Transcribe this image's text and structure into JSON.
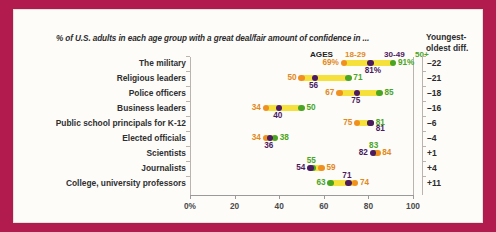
{
  "header": {
    "title": "% of U.S. adults in each age group with a great deal/fair amount of confidence in ...",
    "diff_header": "Youngest-\noldest diff."
  },
  "legend": {
    "ages_label": "AGES",
    "young": "18-29",
    "mid": "30-49",
    "old": "50+"
  },
  "colors": {
    "young": "#f0901e",
    "mid": "#4b1a60",
    "old": "#4aa522",
    "track": "#f5e03c",
    "frame": "#b21b4d",
    "card": "#fdfcf9"
  },
  "chart_data": {
    "type": "scatter",
    "subtype": "dumbbell",
    "title": "% of U.S. adults in each age group with a great deal/fair amount of confidence in ...",
    "xlabel": "",
    "ylabel": "",
    "xlim": [
      0,
      100
    ],
    "xticks": [
      0,
      20,
      40,
      60,
      80,
      100
    ],
    "xticklabels": [
      "0%",
      "20",
      "40",
      "60",
      "80",
      "100"
    ],
    "grid": false,
    "legend_position": "top-right",
    "series": [
      {
        "name": "18-29",
        "color": "#f0901e"
      },
      {
        "name": "30-49",
        "color": "#4b1a60"
      },
      {
        "name": "50+",
        "color": "#4aa522"
      }
    ],
    "categories": [
      "The military",
      "Religious leaders",
      "Police officers",
      "Business leaders",
      "Public school principals for K-12",
      "Elected officials",
      "Scientists",
      "Journalists",
      "College, university professors"
    ],
    "rows": [
      {
        "category": "The military",
        "young": 69,
        "mid": 81,
        "old": 91,
        "young_label": "69%",
        "mid_label": "81%",
        "old_label": "91%",
        "diff": "–22"
      },
      {
        "category": "Religious leaders",
        "young": 50,
        "mid": 56,
        "old": 71,
        "young_label": "50",
        "mid_label": "56",
        "old_label": "71",
        "diff": "–21"
      },
      {
        "category": "Police officers",
        "young": 67,
        "mid": 75,
        "old": 85,
        "young_label": "67",
        "mid_label": "75",
        "old_label": "85",
        "diff": "–18"
      },
      {
        "category": "Business leaders",
        "young": 34,
        "mid": 40,
        "old": 50,
        "young_label": "34",
        "mid_label": "40",
        "old_label": "50",
        "diff": "–16"
      },
      {
        "category": "Public school principals for K-12",
        "young": 75,
        "mid": 81,
        "old": 81,
        "young_label": "75",
        "mid_label": "81",
        "old_label": "81",
        "diff": "–6"
      },
      {
        "category": "Elected officials",
        "young": 34,
        "mid": 36,
        "old": 38,
        "young_label": "34",
        "mid_label": "36",
        "old_label": "38",
        "diff": "–4"
      },
      {
        "category": "Scientists",
        "young": 84,
        "mid": 82,
        "old": 83,
        "young_label": "84",
        "mid_label": "82",
        "old_label": "83",
        "diff": "+1"
      },
      {
        "category": "Journalists",
        "young": 59,
        "mid": 54,
        "old": 55,
        "young_label": "59",
        "mid_label": "54",
        "old_label": "55",
        "diff": "+4"
      },
      {
        "category": "College, university professors",
        "young": 74,
        "mid": 71,
        "old": 63,
        "young_label": "74",
        "mid_label": "71",
        "old_label": "63",
        "diff": "+11"
      }
    ]
  }
}
